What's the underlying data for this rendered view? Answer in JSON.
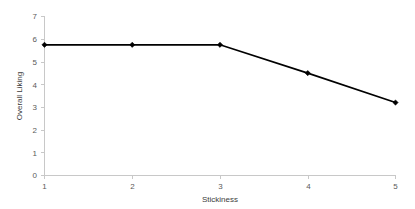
{
  "chart_data": {
    "type": "line",
    "title": "",
    "xlabel": "Stickiness",
    "ylabel": "Overall Liking",
    "x": [
      1,
      2,
      3,
      4,
      5
    ],
    "values": [
      5.75,
      5.75,
      5.75,
      4.5,
      3.2
    ],
    "series": [
      {
        "name": "Overall Liking",
        "values": [
          5.75,
          5.75,
          5.75,
          4.5,
          3.2
        ]
      }
    ],
    "xlim": [
      1,
      5
    ],
    "ylim": [
      0,
      7
    ],
    "xticks": [
      "1",
      "2",
      "3",
      "4",
      "5"
    ],
    "yticks": [
      "0",
      "1",
      "2",
      "3",
      "4",
      "5",
      "6",
      "7"
    ],
    "grid": false,
    "legend": "none",
    "line_color": "#000000",
    "marker_color": "#000000",
    "axis_color": "#c8c8c8",
    "text_color": "#5a5a5a"
  },
  "axes": {
    "x_title": "Stickiness",
    "y_title": "Overall Liking",
    "x_tick_labels": [
      "1",
      "2",
      "3",
      "4",
      "5"
    ],
    "y_tick_labels": [
      "0",
      "1",
      "2",
      "3",
      "4",
      "5",
      "6",
      "7"
    ]
  }
}
